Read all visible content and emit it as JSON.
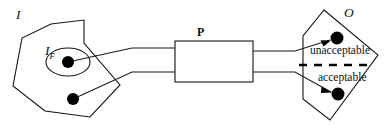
{
  "figure": {
    "type": "process-flow-diagram",
    "background_color": "#ffffff",
    "line_color": "#141414"
  },
  "labels": {
    "input_region": "I",
    "input_focus": "I",
    "input_focus_subscript": "F",
    "process_box": "P",
    "output_region": "O",
    "outcome_unacceptable": "unacceptable",
    "outcome_acceptable": "acceptable"
  },
  "shapes": {
    "input_polygon": {
      "name": "input-region-polygon",
      "points": "51,24 84,20 84,43 120,85 90,117 45,111 13,86 22,38"
    },
    "input_focus_ellipse": {
      "name": "input-focus-ellipse",
      "cx": 68,
      "cy": 62,
      "rx": 22,
      "ry": 14
    },
    "process_rect": {
      "name": "process-box",
      "x": 175,
      "y": 41,
      "width": 78,
      "height": 41
    },
    "output_polygon": {
      "name": "output-region-polygon",
      "points": "324,10 378,55 330,120 303,99 303,36"
    },
    "divider": {
      "name": "acceptability-divider",
      "x1": 299,
      "y1": 65,
      "x2": 374,
      "y2": 65,
      "style": "dashed"
    }
  },
  "points": [
    {
      "name": "input-focus-point",
      "cx": 68,
      "cy": 62,
      "r": 6
    },
    {
      "name": "input-other-point",
      "cx": 73,
      "cy": 99,
      "r": 6
    },
    {
      "name": "output-unacceptable-point",
      "cx": 337,
      "cy": 38,
      "r": 6.5
    },
    {
      "name": "output-acceptable-point",
      "cx": 338,
      "cy": 94,
      "r": 6.5
    }
  ],
  "connectors": [
    {
      "name": "focus-to-process-upper",
      "path": "M 68 62 L 132 48 L 175 48"
    },
    {
      "name": "other-to-process-lower",
      "path": "M 73 99 L 132 72 L 175 72"
    },
    {
      "name": "process-to-unacceptable",
      "path": "M 253 51 L 295 51 L 330 40"
    },
    {
      "name": "process-to-acceptable",
      "path": "M 253 72 L 295 72 L 331 92"
    }
  ]
}
